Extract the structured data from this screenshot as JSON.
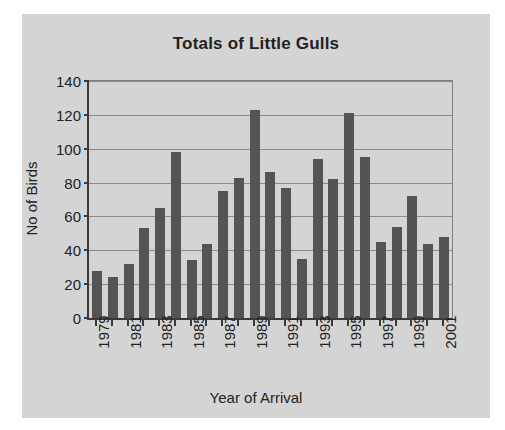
{
  "chart_data": {
    "type": "bar",
    "title": "Totals of Little Gulls",
    "xlabel": "Year of Arrival",
    "ylabel": "No of Birds",
    "ylim": [
      0,
      140
    ],
    "ytick_step": 20,
    "yticks": [
      0,
      20,
      40,
      60,
      80,
      100,
      120,
      140
    ],
    "ytick_labels": [
      "0",
      "20",
      "40",
      "60",
      "80",
      "100",
      "120",
      "140"
    ],
    "grid": "horizontal",
    "legend": "none",
    "bar_color": "#545454",
    "plot_background": "#d4d4d4",
    "categories": [
      "1979",
      "1980",
      "1981",
      "1982",
      "1983",
      "1984",
      "1985",
      "1986",
      "1987",
      "1988",
      "1989",
      "1990",
      "1991",
      "1992",
      "1993",
      "1994",
      "1995",
      "1996",
      "1997",
      "1998",
      "1999",
      "2000",
      "2001"
    ],
    "values": [
      28,
      24,
      32,
      53,
      65,
      98,
      34,
      44,
      75,
      83,
      123,
      86,
      77,
      35,
      94,
      82,
      121,
      95,
      45,
      54,
      72,
      44,
      48
    ],
    "xtick_labels": [
      "1979",
      "",
      "1981",
      "",
      "1983",
      "",
      "1985",
      "",
      "1987",
      "",
      "1989",
      "",
      "1991",
      "",
      "1993",
      "",
      "1995",
      "",
      "1997",
      "",
      "1999",
      "",
      "2001"
    ]
  }
}
